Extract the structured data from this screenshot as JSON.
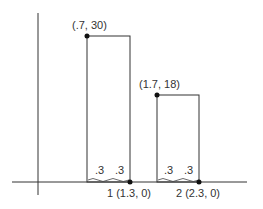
{
  "diagram": {
    "points": {
      "top_left_1": "(.7, 30)",
      "top_left_2": "(1.7, 18)",
      "bottom_right_1": "1 (1.3, 0)",
      "bottom_right_2": "2 (2.3, 0)"
    },
    "half_widths": {
      "bar1_left": ".3",
      "bar1_right": ".3",
      "bar2_left": ".3",
      "bar2_right": ".3"
    },
    "colors": {
      "line": "#333333",
      "dot": "#111111",
      "background": "#ffffff"
    }
  }
}
